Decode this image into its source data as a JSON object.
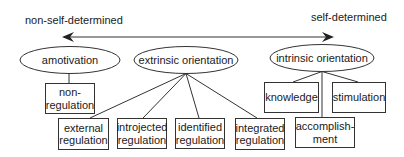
{
  "axis": {
    "left_label": "non-self-determined",
    "right_label": "self-determined"
  },
  "orientations": [
    {
      "id": "amotivation",
      "label": "amotivation"
    },
    {
      "id": "extrinsic",
      "label": "extrinsic orientation"
    },
    {
      "id": "intrinsic",
      "label": "intrinsic orientation"
    }
  ],
  "regulations": {
    "non_regulation": {
      "line1": "non-",
      "line2": "regulation"
    },
    "external": {
      "line1": "external",
      "line2": "regulation"
    },
    "introjected": {
      "line1": "introjected",
      "line2": "regulation"
    },
    "identified": {
      "line1": "identified",
      "line2": "regulation"
    },
    "integrated": {
      "line1": "integrated",
      "line2": "regulation"
    }
  },
  "intrinsic_types": {
    "knowledge": "knowledge",
    "stimulation": "stimulation",
    "accomplishment": {
      "line1": "accomplish-",
      "line2": "ment"
    }
  },
  "colors": {
    "stroke": "#333333",
    "text": "#1a1a1a",
    "background": "#ffffff"
  }
}
